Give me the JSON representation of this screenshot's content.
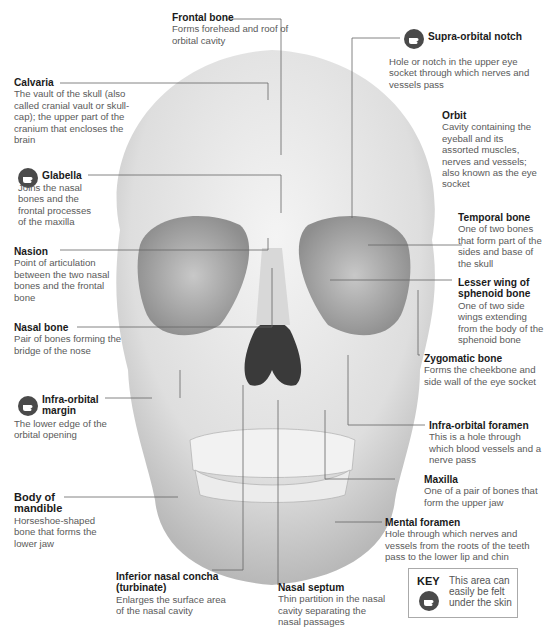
{
  "colors": {
    "label_title": "#1a1a1a",
    "label_text": "#5a5a5a",
    "leader_line": "#666666",
    "bone": "#e4e4e4",
    "icon_bg": "#4a4a4a"
  },
  "labels": [
    {
      "id": "frontal-bone",
      "title": "Frontal bone",
      "desc": "Forms forehead and roof of orbital cavity",
      "palpable": false
    },
    {
      "id": "supra-orbital-notch",
      "title": "Supra-orbital notch",
      "desc": "Hole or notch in the upper eye socket through which nerves and vessels pass",
      "palpable": true
    },
    {
      "id": "calvaria",
      "title": "Calvaria",
      "desc": "The vault of the skull (also called cranial vault or skull-cap); the upper part of the cranium that encloses the brain",
      "palpable": false
    },
    {
      "id": "orbit",
      "title": "Orbit",
      "desc": "Cavity containing the eyeball and its assorted muscles, nerves and vessels; also known as the eye socket",
      "palpable": false
    },
    {
      "id": "glabella",
      "title": "Glabella",
      "desc": "Joins the nasal bones and the frontal processes of the maxilla",
      "palpable": true
    },
    {
      "id": "temporal-bone",
      "title": "Temporal bone",
      "desc": "One of two bones that form part of the sides and base of the skull",
      "palpable": false
    },
    {
      "id": "nasion",
      "title": "Nasion",
      "desc": "Point of articulation between the two nasal bones and the frontal bone",
      "palpable": false
    },
    {
      "id": "lesser-wing-sphenoid",
      "title": "Lesser wing of sphenoid bone",
      "desc": "One of two side wings extending from the body of the sphenoid bone",
      "palpable": false
    },
    {
      "id": "nasal-bone",
      "title": "Nasal bone",
      "desc": "Pair of bones forming the bridge of the nose",
      "palpable": false
    },
    {
      "id": "zygomatic-bone",
      "title": "Zygomatic bone",
      "desc": "Forms the cheekbone and side wall of the eye socket",
      "palpable": false
    },
    {
      "id": "infra-orbital-margin",
      "title": "Infra-orbital margin",
      "desc": "The lower edge of the orbital opening",
      "palpable": true
    },
    {
      "id": "infra-orbital-foramen",
      "title": "Infra-orbital foramen",
      "desc": "This is a hole through which blood vessels and a nerve pass",
      "palpable": false
    },
    {
      "id": "maxilla",
      "title": "Maxilla",
      "desc": "One of a pair of bones that form the upper jaw",
      "palpable": false
    },
    {
      "id": "body-of-mandible",
      "title": "Body of mandible",
      "desc": "Horseshoe-shaped bone that forms the lower jaw",
      "palpable": false
    },
    {
      "id": "mental-foramen",
      "title": "Mental foramen",
      "desc": "Hole through which nerves and vessels from the roots of the teeth pass to the lower lip and chin",
      "palpable": false
    },
    {
      "id": "inferior-nasal-concha",
      "title": "Inferior nasal concha (turbinate)",
      "desc": "Enlarges the surface area of the nasal cavity",
      "palpable": false
    },
    {
      "id": "nasal-septum",
      "title": "Nasal septum",
      "desc": "Thin partition in the nasal cavity separating the nasal passages",
      "palpable": false
    }
  ],
  "key": {
    "title": "KEY",
    "desc": "This area can easily be felt under the skin",
    "icon": "hand-press-icon"
  }
}
